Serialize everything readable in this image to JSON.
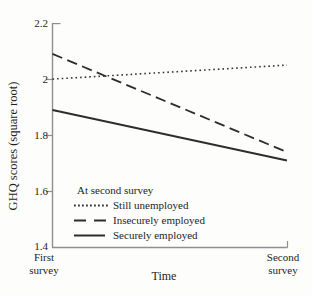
{
  "figure": {
    "background": "#fdfdfb",
    "data_line_color": "#2d2d2d",
    "axis_color": "#8f8f8f"
  },
  "chart_data": {
    "type": "line",
    "title": "",
    "xlabel": "Time",
    "ylabel": "GHQ scores (square root)",
    "x_categories": [
      "First survey",
      "Second survey"
    ],
    "x_tick_display": [
      "First\nsurvey",
      "Second\nsurvey"
    ],
    "yticks": [
      2.2,
      2,
      1.8,
      1.6,
      1.4
    ],
    "ylim": [
      1.4,
      2.2
    ],
    "grid": false,
    "legend": {
      "title": "At second survey",
      "position": "inside-lower-left"
    },
    "series": [
      {
        "name": "Still unemployed",
        "style": "dotted",
        "values": [
          2.0,
          2.05
        ]
      },
      {
        "name": "Insecurely employed",
        "style": "dashed",
        "values": [
          2.09,
          1.74
        ]
      },
      {
        "name": "Securely employed",
        "style": "solid",
        "values": [
          1.89,
          1.71
        ]
      }
    ]
  }
}
